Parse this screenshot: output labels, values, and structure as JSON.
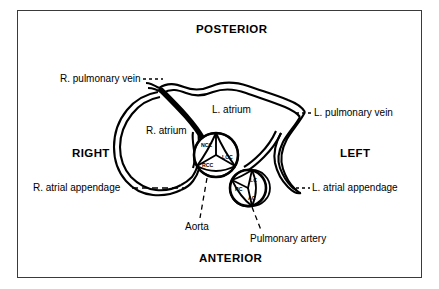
{
  "figure": {
    "border_color": "#3a3a3a",
    "ink_color": "#000000",
    "background_color": "#ffffff"
  },
  "orientation_labels": {
    "posterior": "POSTERIOR",
    "anterior": "ANTERIOR",
    "right": "RIGHT",
    "left": "LEFT"
  },
  "chamber_labels": {
    "right_atrium": "R. atrium",
    "left_atrium": "L. atrium"
  },
  "annotations": {
    "r_pulmonary_vein": "R. pulmonary vein",
    "l_pulmonary_vein": "L. pulmonary vein",
    "r_atrial_appendage": "R. atrial appendage",
    "l_atrial_appendage": "L. atrial appendage",
    "aorta": "Aorta",
    "pulmonary_artery": "Pulmonary artery"
  },
  "aortic_valve": {
    "name": "Aorta",
    "cusps": [
      {
        "abbr": "NCC",
        "meaning": "non-coronary cusp"
      },
      {
        "abbr": "LCC",
        "meaning": "left coronary cusp"
      },
      {
        "abbr": "RCC",
        "meaning": "right coronary cusp"
      }
    ]
  },
  "pulmonary_valve": {
    "name": "Pulmonary artery",
    "cusps": [
      {
        "abbr": "LC",
        "meaning": "left cusp"
      },
      {
        "abbr": "RC",
        "meaning": "right cusp"
      },
      {
        "abbr": "AC",
        "meaning": "anterior cusp"
      }
    ]
  }
}
